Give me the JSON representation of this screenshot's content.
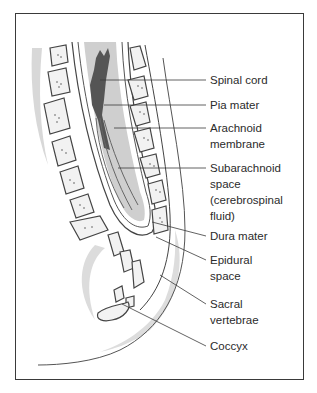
{
  "diagram": {
    "labels": [
      {
        "id": "spinal-cord",
        "text": "Spinal cord",
        "top": 72
      },
      {
        "id": "pia-mater",
        "text": "Pia mater",
        "top": 97
      },
      {
        "id": "arachnoid-membrane",
        "text": "Arachnoid\nmembrane",
        "top": 120
      },
      {
        "id": "subarachnoid-space",
        "text": "Subarachnoid\nspace\n(cerebrospinal\nfluid)",
        "top": 160
      },
      {
        "id": "dura-mater",
        "text": "Dura mater",
        "top": 228
      },
      {
        "id": "epidural-space",
        "text": "Epidural\nspace",
        "top": 252
      },
      {
        "id": "sacral-vertebrae",
        "text": "Sacral\nvertebrae",
        "top": 296
      },
      {
        "id": "coccyx",
        "text": "Coccyx",
        "top": 338
      }
    ],
    "colors": {
      "line": "#3a3a3a",
      "cord": "#555555",
      "shade": "#c8c8c8",
      "light_shade": "#dedede"
    }
  }
}
